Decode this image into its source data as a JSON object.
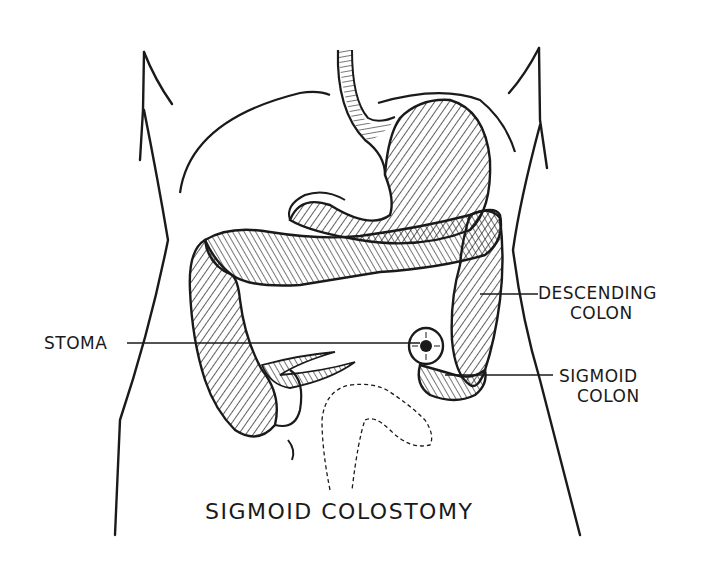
{
  "diagram": {
    "title": "SIGMOID COLOSTOMY",
    "style": "black-and-white pen-and-ink anatomical illustration",
    "colors": {
      "ink": "#1a1a1a",
      "background": "#ffffff"
    },
    "labels": [
      {
        "id": "descending-colon",
        "line1": "DESCENDING",
        "line2": "COLON"
      },
      {
        "id": "stoma",
        "line1": "STOMA"
      },
      {
        "id": "sigmoid-colon",
        "line1": "SIGMOID",
        "line2": "COLON"
      }
    ],
    "structures": [
      "torso-outline",
      "rib-cage-arcs",
      "esophagus",
      "stomach",
      "transverse-colon",
      "ascending-colon",
      "cecum-and-appendix",
      "descending-colon",
      "sigmoid-colon",
      "stoma",
      "rectum-dashed-outline",
      "small-bowel-loop"
    ]
  }
}
